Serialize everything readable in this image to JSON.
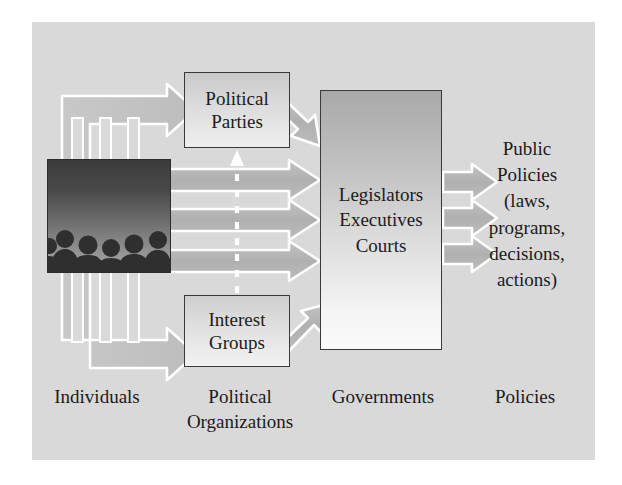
{
  "figure": {
    "background_color": "#ffffff",
    "panel_color": "#d9d9d9",
    "arrow_fill": "#b4b4b4",
    "arrow_outline": "#ffffff",
    "band_fill": "#c4c4c4",
    "box_border_color": "#3a3a3a",
    "text_color": "#1b1b1b"
  },
  "nodes": {
    "individuals_image": {
      "name": "crowd-of-people-photo",
      "description": "silhouettes of people against a dark gradient sky",
      "people_count": 6
    },
    "political_parties": {
      "line1": "Political",
      "line2": "Parties"
    },
    "interest_groups": {
      "line1": "Interest",
      "line2": "Groups"
    },
    "governments": {
      "line1": "Legislators",
      "line2": "Executives",
      "line3": "Courts"
    }
  },
  "policies_text": {
    "line1": "Public",
    "line2": "Policies",
    "line3": "(laws,",
    "line4": "programs,",
    "line5": "decisions,",
    "line6": "actions)"
  },
  "captions": {
    "individuals": "Individuals",
    "political_organizations_line1": "Political",
    "political_organizations_line2": "Organizations",
    "governments": "Governments",
    "policies": "Policies"
  },
  "flow": {
    "stages": [
      "Individuals",
      "Political Organizations",
      "Governments",
      "Policies"
    ],
    "connections": [
      {
        "from": "Individuals",
        "to": "Political Parties",
        "style": "thick-arrow-up-right"
      },
      {
        "from": "Individuals",
        "to": "Governments",
        "style": "thick-arrow-right",
        "count": 3
      },
      {
        "from": "Individuals",
        "to": "Interest Groups",
        "style": "thick-arrow-down-right"
      },
      {
        "from": "Political Parties",
        "to": "Governments",
        "style": "diagonal-arrow-down-right"
      },
      {
        "from": "Interest Groups",
        "to": "Governments",
        "style": "diagonal-arrow-up-right"
      },
      {
        "from": "Interest Groups",
        "to": "Political Parties",
        "style": "dashed-arrow-up"
      },
      {
        "from": "Governments",
        "to": "Public Policies",
        "style": "arrow-right",
        "count": 3
      }
    ]
  }
}
